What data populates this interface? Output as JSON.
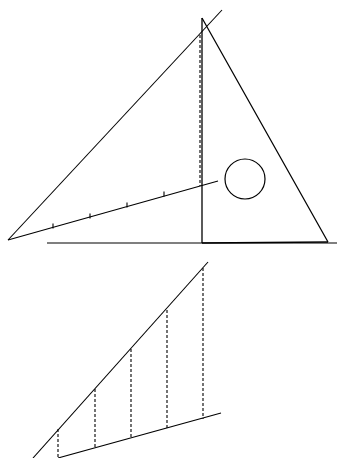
{
  "diagram": {
    "title": "",
    "stroke_color": "#000000",
    "background": "#ffffff",
    "top_figure": {
      "triangle": {
        "apex": [
          202,
          18
        ],
        "base_left": [
          202,
          243
        ],
        "base_right": [
          328,
          242
        ]
      },
      "baseline": {
        "from": [
          47,
          243
        ],
        "to": [
          337,
          243
        ]
      },
      "diagonal_line": {
        "from": [
          8,
          240
        ],
        "to": [
          222,
          10
        ]
      },
      "tick_line": {
        "from": [
          8,
          240
        ],
        "to": [
          218,
          181
        ],
        "ticks": [
          [
            53,
            226
          ],
          [
            90,
            216
          ],
          [
            127,
            205
          ],
          [
            164,
            194
          ]
        ]
      },
      "dashed_vertical": {
        "x": 200,
        "from_y": 35,
        "to_y": 186
      },
      "circle": {
        "cx": 245,
        "cy": 179,
        "r": 20
      }
    },
    "bottom_figure": {
      "diagonal_line": {
        "from": [
          33,
          458
        ],
        "to": [
          208,
          262
        ]
      },
      "bottom_line": {
        "from": [
          58,
          458
        ],
        "to": [
          221,
          413
        ]
      },
      "dashed_verticals": [
        {
          "x": 58,
          "top": 429,
          "bottom": 458
        },
        {
          "x": 95,
          "top": 389,
          "bottom": 449
        },
        {
          "x": 131,
          "top": 349,
          "bottom": 439
        },
        {
          "x": 167,
          "top": 310,
          "bottom": 429
        },
        {
          "x": 203,
          "top": 268,
          "bottom": 419
        }
      ]
    }
  }
}
